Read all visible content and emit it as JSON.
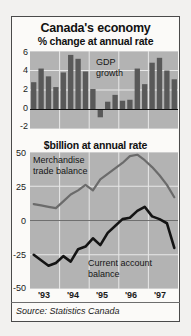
{
  "figure": {
    "title": "Canada's economy",
    "source": "Source: Statistics Canada",
    "background": "#f2f1ef",
    "plot_background": "#b3b3b3",
    "frame_color": "#4a4a4a"
  },
  "axis": {
    "top_ticks": [
      "6",
      "4",
      "2",
      "0",
      "-2"
    ],
    "bottom_ticks": [
      "50",
      "25",
      "0",
      "-25",
      "-50"
    ],
    "years": [
      "'93",
      "'94",
      "'95",
      "'96",
      "'97"
    ]
  },
  "labels": {
    "gdp": "GDP",
    "growth": "growth",
    "merchandise": "Merchandise",
    "trade_balance": "trade balance",
    "current_account": "Current account",
    "balance": "balance"
  },
  "chart_data": [
    {
      "type": "bar",
      "title": "Canada's economy",
      "subtitle": "% change at annual rate",
      "xlabel": "",
      "ylabel": "% change at annual rate",
      "ylim": [
        -2,
        6
      ],
      "yticks": [
        6,
        4,
        2,
        0,
        -2
      ],
      "grid": true,
      "legend": "GDP growth",
      "series_name": "GDP growth",
      "bar_color": "#595959",
      "categories": [
        "1993Q1",
        "1993Q2",
        "1993Q3",
        "1993Q4",
        "1994Q1",
        "1994Q2",
        "1994Q3",
        "1994Q4",
        "1995Q1",
        "1995Q2",
        "1995Q3",
        "1995Q4",
        "1996Q1",
        "1996Q2",
        "1996Q3",
        "1996Q4",
        "1997Q1",
        "1997Q2",
        "1997Q3",
        "1997Q4"
      ],
      "categories_short": [
        "'93",
        "'93",
        "'93",
        "'93",
        "'94",
        "'94",
        "'94",
        "'94",
        "'95",
        "'95",
        "'95",
        "'95",
        "'96",
        "'96",
        "'96",
        "'96",
        "'97",
        "'97",
        "'97",
        "'97"
      ],
      "values": [
        2.8,
        4.2,
        3.4,
        2.3,
        3.8,
        5.6,
        5.2,
        3.9,
        2.1,
        -0.8,
        0.8,
        1.5,
        0.9,
        1.0,
        4.2,
        2.6,
        4.8,
        5.3,
        4.0,
        3.1
      ]
    },
    {
      "type": "line",
      "title": "$billion at annual rate",
      "subtitle": "$billion at annual rate",
      "xlabel": "",
      "ylabel": "$billion at annual rate",
      "ylim": [
        -50,
        50
      ],
      "yticks": [
        50,
        25,
        0,
        -25,
        -50
      ],
      "grid": true,
      "x": [
        "1993Q1",
        "1993Q2",
        "1993Q3",
        "1993Q4",
        "1994Q1",
        "1994Q2",
        "1994Q3",
        "1994Q4",
        "1995Q1",
        "1995Q2",
        "1995Q3",
        "1995Q4",
        "1996Q1",
        "1996Q2",
        "1996Q3",
        "1996Q4",
        "1997Q1",
        "1997Q2",
        "1997Q3",
        "1997Q4"
      ],
      "series": [
        {
          "name": "Merchandise trade balance",
          "color": "#6b6b6b",
          "values": [
            12,
            11,
            10,
            9,
            14,
            19,
            22,
            26,
            22,
            30,
            34,
            38,
            42,
            47,
            48,
            44,
            39,
            33,
            26,
            17
          ]
        },
        {
          "name": "Current account balance",
          "color": "#141414",
          "values": [
            -25,
            -29,
            -33,
            -31,
            -26,
            -30,
            -21,
            -19,
            -13,
            -18,
            -9,
            -4,
            1,
            2,
            7,
            10,
            3,
            1,
            -2,
            -20
          ]
        }
      ]
    }
  ]
}
